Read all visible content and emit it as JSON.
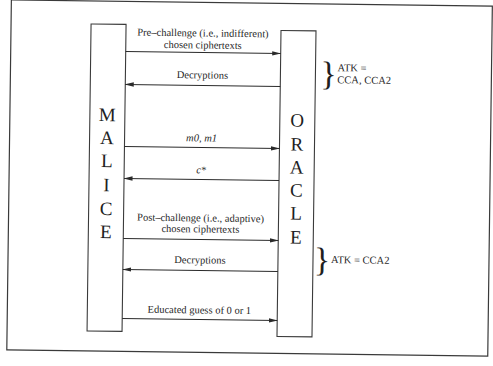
{
  "diagram": {
    "type": "sequence",
    "participants": {
      "left": {
        "name": "MALICE",
        "letters": [
          "M",
          "A",
          "L",
          "I",
          "C",
          "E"
        ]
      },
      "right": {
        "name": "ORACLE",
        "letters": [
          "O",
          "R",
          "A",
          "C",
          "L",
          "E"
        ]
      }
    },
    "messages": [
      {
        "id": "pre_challenge",
        "direction": "left-to-right",
        "lines": [
          "Pre–challenge (i.e., indifferent)",
          "chosen ciphertexts"
        ],
        "italic": false
      },
      {
        "id": "decryptions_1",
        "direction": "right-to-left",
        "lines": [
          "Decryptions"
        ],
        "italic": false
      },
      {
        "id": "m0_m1",
        "direction": "left-to-right",
        "lines": [
          "m0, m1"
        ],
        "italic": true
      },
      {
        "id": "c_star",
        "direction": "right-to-left",
        "lines": [
          "c*"
        ],
        "italic": true
      },
      {
        "id": "post_challenge",
        "direction": "left-to-right",
        "lines": [
          "Post–challenge (i.e., adaptive)",
          "chosen ciphertexts"
        ],
        "italic": false
      },
      {
        "id": "decryptions_2",
        "direction": "right-to-left",
        "lines": [
          "Decryptions"
        ],
        "italic": false
      },
      {
        "id": "educated_guess",
        "direction": "left-to-right",
        "lines": [
          "Educated guess of 0 or 1"
        ],
        "italic": false
      }
    ],
    "annotations": [
      {
        "id": "atk_pre",
        "brace": "}",
        "lines": [
          "ATK =",
          "CCA, CCA2"
        ],
        "spans": [
          "pre_challenge",
          "decryptions_1"
        ]
      },
      {
        "id": "atk_post",
        "brace": "}",
        "lines": [
          "ATK = CCA2"
        ],
        "spans": [
          "post_challenge",
          "decryptions_2"
        ]
      }
    ]
  }
}
